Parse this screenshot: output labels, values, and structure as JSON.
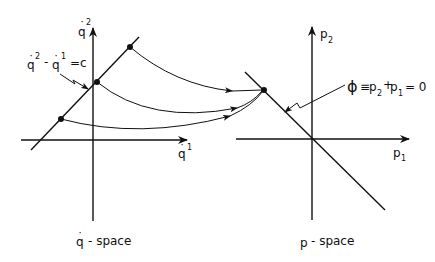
{
  "left_panel": {
    "vertical_axis_label": "q",
    "vertical_axis_superscript": "2",
    "horizontal_axis_label": "q",
    "horizontal_axis_superscript": "1",
    "constraint_label": {
      "q2": "q",
      "q2_sup": "2",
      "minus": "-",
      "q1": "q",
      "q1_sup": "1",
      "eq": "=c"
    },
    "caption": {
      "symbol": "q",
      "text": "- space"
    }
  },
  "right_panel": {
    "vertical_axis_label": "p",
    "vertical_axis_subscript": "2",
    "horizontal_axis_label": "p",
    "horizontal_axis_subscript": "1",
    "constraint_label": {
      "phi": "ϕ",
      "equiv": "≡",
      "p2": "p",
      "p2_sub": "2",
      "plus": "+",
      "p1": "p",
      "p1_sub": "1",
      "eq": "= 0"
    },
    "caption": {
      "symbol": "p",
      "text": "- space"
    }
  },
  "mapping": {
    "source_points": 3,
    "target_points": 1,
    "description": "three points on the line q̇² − q̇¹ = c map to a single point on ϕ = 0"
  }
}
